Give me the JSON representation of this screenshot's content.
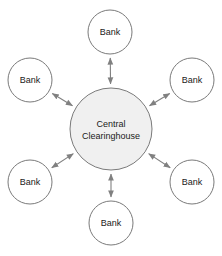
{
  "diagram": {
    "background_color": "#ffffff",
    "node_stroke_color": "#7a7a7a",
    "node_fill_color": "#ffffff",
    "hub_fill_color": "#f0f0f0",
    "connector_color": "#808080",
    "label_color": "#1a1a1a",
    "hub": {
      "id": "central-clearinghouse",
      "line1": "Central",
      "line2": "Clearinghouse",
      "cx": 111,
      "cy": 129,
      "r": 41
    },
    "nodes": [
      {
        "id": "bank-top",
        "label": "Bank",
        "cx": 110,
        "cy": 32,
        "r": 22
      },
      {
        "id": "bank-upper-left",
        "label": "Bank",
        "cx": 30,
        "cy": 80,
        "r": 22
      },
      {
        "id": "bank-upper-right",
        "label": "Bank",
        "cx": 192,
        "cy": 80,
        "r": 22
      },
      {
        "id": "bank-lower-left",
        "label": "Bank",
        "cx": 30,
        "cy": 182,
        "r": 22
      },
      {
        "id": "bank-lower-right",
        "label": "Bank",
        "cx": 192,
        "cy": 182,
        "r": 22
      },
      {
        "id": "bank-bottom",
        "label": "Bank",
        "cx": 111,
        "cy": 223,
        "r": 22
      }
    ],
    "connectors": [
      {
        "id": "link-hub-bank-top",
        "from": "central-clearinghouse",
        "to": "bank-top",
        "arrow": "double"
      },
      {
        "id": "link-hub-bank-upper-left",
        "from": "central-clearinghouse",
        "to": "bank-upper-left",
        "arrow": "double"
      },
      {
        "id": "link-hub-bank-upper-right",
        "from": "central-clearinghouse",
        "to": "bank-upper-right",
        "arrow": "double"
      },
      {
        "id": "link-hub-bank-lower-left",
        "from": "central-clearinghouse",
        "to": "bank-lower-left",
        "arrow": "double"
      },
      {
        "id": "link-hub-bank-lower-right",
        "from": "central-clearinghouse",
        "to": "bank-lower-right",
        "arrow": "double"
      },
      {
        "id": "link-hub-bank-bottom",
        "from": "central-clearinghouse",
        "to": "bank-bottom",
        "arrow": "double"
      }
    ]
  }
}
